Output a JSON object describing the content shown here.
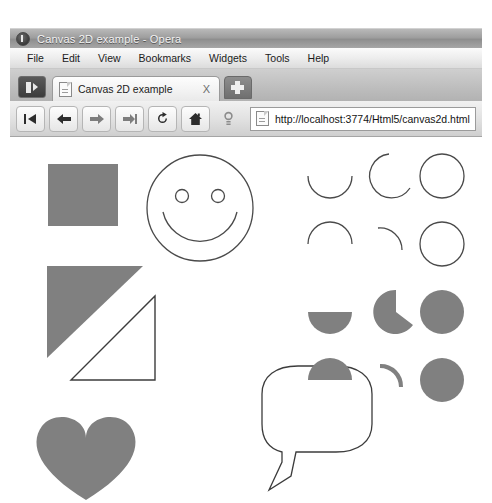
{
  "window": {
    "title": "Canvas 2D example - Opera",
    "app_icon": "opera-icon"
  },
  "menubar": {
    "items": [
      {
        "label": "File"
      },
      {
        "label": "Edit"
      },
      {
        "label": "View"
      },
      {
        "label": "Bookmarks"
      },
      {
        "label": "Widgets"
      },
      {
        "label": "Tools"
      },
      {
        "label": "Help"
      }
    ]
  },
  "tabbar": {
    "panel_toggle_title": "Panels",
    "tabs": [
      {
        "label": "Canvas 2D example",
        "close_label": "X",
        "icon": "page-icon"
      }
    ],
    "new_tab_label": "+"
  },
  "navbar": {
    "buttons": [
      {
        "name": "rewind-button",
        "icon": "rewind-icon"
      },
      {
        "name": "back-button",
        "icon": "arrow-left-icon"
      },
      {
        "name": "forward-button",
        "icon": "arrow-right-icon"
      },
      {
        "name": "fastforward-button",
        "icon": "fast-forward-icon"
      },
      {
        "name": "reload-button",
        "icon": "reload-icon"
      },
      {
        "name": "home-button",
        "icon": "home-icon"
      },
      {
        "name": "search-button",
        "icon": "magnifier-icon"
      }
    ],
    "address": {
      "url": "http://localhost:3774/Html5/canvas2d.html",
      "placeholder": "http://localhost:3774/Html5/canvas2d.html",
      "favicon": "page-icon"
    }
  },
  "canvas": {
    "fill_color": "#808080",
    "stroke_color": "#4a4a4a",
    "shapes": [
      {
        "name": "filled-square",
        "kind": "rect",
        "style": "fill"
      },
      {
        "name": "smiley-face",
        "kind": "face",
        "style": "stroke"
      },
      {
        "name": "filled-triangle",
        "kind": "triangle",
        "style": "fill"
      },
      {
        "name": "outlined-triangle",
        "kind": "triangle",
        "style": "stroke"
      },
      {
        "name": "filled-heart",
        "kind": "heart",
        "style": "fill"
      },
      {
        "name": "speech-bubble",
        "kind": "speech-bubble",
        "style": "stroke"
      },
      {
        "name": "arc-grid",
        "kind": "arc-grid",
        "style": "mixed",
        "rows": 4,
        "cols": 3,
        "cells": [
          {
            "name": "arc-stroke-half-bottom",
            "style": "stroke",
            "sweep": "half",
            "start": 0
          },
          {
            "name": "arc-stroke-three-quarter",
            "style": "stroke",
            "sweep": "three-quarter",
            "start": 0
          },
          {
            "name": "arc-stroke-full-circle",
            "style": "stroke",
            "sweep": "full",
            "start": 0
          },
          {
            "name": "arc-stroke-half-top",
            "style": "stroke",
            "sweep": "half",
            "start": 180
          },
          {
            "name": "arc-stroke-quarter",
            "style": "stroke",
            "sweep": "quarter",
            "start": 200
          },
          {
            "name": "arc-stroke-full-circle-2",
            "style": "stroke",
            "sweep": "full",
            "start": 0
          },
          {
            "name": "arc-fill-half-bottom",
            "style": "fill",
            "sweep": "half",
            "start": 0
          },
          {
            "name": "arc-fill-three-quarter",
            "style": "fill",
            "sweep": "three-quarter",
            "start": 0
          },
          {
            "name": "arc-fill-full-circle",
            "style": "fill",
            "sweep": "full",
            "start": 0
          },
          {
            "name": "arc-fill-half-top",
            "style": "fill",
            "sweep": "half",
            "start": 180
          },
          {
            "name": "arc-fill-sliver",
            "style": "fill",
            "sweep": "quarter",
            "start": 200
          },
          {
            "name": "arc-fill-full-circle-2",
            "style": "fill",
            "sweep": "full",
            "start": 0
          }
        ]
      }
    ]
  }
}
